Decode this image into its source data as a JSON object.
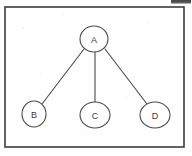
{
  "page": {
    "width": 192,
    "height": 156,
    "background_color": "#fefefe",
    "ink_color": "#4a4a4a",
    "border_color": "#3c3c3c",
    "label_color": "#3a3a3a",
    "artifact_color": "#4b4b4b"
  },
  "frame": {
    "name": "diagram-border",
    "x": 5,
    "y": 7,
    "width": 179,
    "height": 140,
    "stroke_width": 1.6
  },
  "artifact": {
    "name": "scan-smudge",
    "x": 171,
    "y": 0,
    "width": 20,
    "height": 4
  },
  "diagram": {
    "type": "tree",
    "title": "",
    "root": "A",
    "nodes": [
      {
        "id": "A",
        "label": "A",
        "cx": 94,
        "cy": 39,
        "rx": 14,
        "ry": 13
      },
      {
        "id": "B",
        "label": "B",
        "cx": 34,
        "cy": 114,
        "rx": 12,
        "ry": 13
      },
      {
        "id": "C",
        "label": "C",
        "cx": 95,
        "cy": 115,
        "rx": 15,
        "ry": 13
      },
      {
        "id": "D",
        "label": "D",
        "cx": 155,
        "cy": 115,
        "rx": 15,
        "ry": 13
      }
    ],
    "edges": [
      {
        "id": "A-B",
        "from": "A",
        "to": "B",
        "x1": 84,
        "y1": 49,
        "x2": 42,
        "y2": 104
      },
      {
        "id": "A-C",
        "from": "A",
        "to": "C",
        "x1": 95,
        "y1": 52,
        "x2": 95,
        "y2": 102
      },
      {
        "id": "A-D",
        "from": "A",
        "to": "D",
        "x1": 105,
        "y1": 49,
        "x2": 147,
        "y2": 104
      }
    ],
    "node_stroke_width": 1.1,
    "edge_stroke_width": 1.1
  }
}
